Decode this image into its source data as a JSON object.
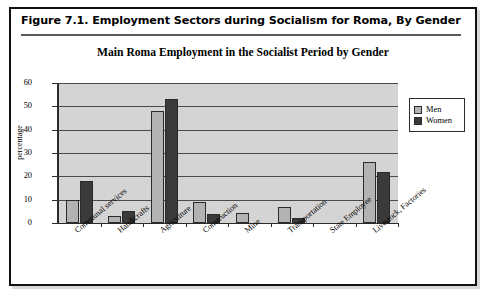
{
  "figure": {
    "caption": "Figure 7.1.  Employment Sectors during Socialism for Roma, By Gender"
  },
  "chart_data": {
    "type": "bar",
    "title": "Main Roma Employment in the Socialist Period by Gender",
    "xlabel": "",
    "ylabel": "percentage",
    "ylim": [
      0,
      60
    ],
    "yticks": [
      0,
      10,
      20,
      30,
      40,
      50,
      60
    ],
    "grid": true,
    "legend_position": "right",
    "categories": [
      "Communal services",
      "Handicrafts",
      "Agriculture",
      "Construction",
      "Mine",
      "Transportation",
      "State Employee",
      "Livestock, Factories"
    ],
    "series": [
      {
        "name": "Men",
        "color": "#b3b3b3",
        "values": [
          10,
          3,
          48,
          9,
          4.5,
          7,
          0,
          26
        ]
      },
      {
        "name": "Women",
        "color": "#3a3a3a",
        "values": [
          18,
          5,
          53,
          4,
          0,
          2,
          0,
          22
        ]
      }
    ]
  }
}
